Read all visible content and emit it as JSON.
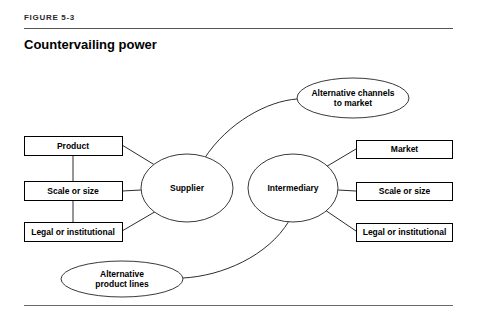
{
  "header": {
    "figure_label": "FIGURE 5-3",
    "title": "Countervailing power"
  },
  "diagram": {
    "type": "relationship-diagram",
    "central_nodes": [
      {
        "id": "supplier",
        "label": "Supplier",
        "shape": "ellipse",
        "cx": 187,
        "cy": 188,
        "rx": 46,
        "ry": 34
      },
      {
        "id": "intermediary",
        "label": "Intermediary",
        "shape": "ellipse",
        "cx": 293,
        "cy": 188,
        "rx": 45,
        "ry": 34
      }
    ],
    "outer_nodes": [
      {
        "id": "alt-channels",
        "label": "Alternative channels\nto market",
        "shape": "ellipse",
        "cx": 353,
        "cy": 98,
        "rx": 56,
        "ry": 20
      },
      {
        "id": "alt-product-lines",
        "label": "Alternative\nproduct lines",
        "shape": "ellipse",
        "cx": 122,
        "cy": 279,
        "rx": 61,
        "ry": 18
      }
    ],
    "left_boxes": [
      {
        "id": "left-product",
        "label": "Product",
        "x": 24,
        "y": 136,
        "w": 98,
        "h": 19
      },
      {
        "id": "left-scale-or-size",
        "label": "Scale or size",
        "x": 24,
        "y": 181,
        "w": 98,
        "h": 19
      },
      {
        "id": "left-legal-or-institutional",
        "label": "Legal or institutional",
        "x": 24,
        "y": 222,
        "w": 98,
        "h": 19
      }
    ],
    "right_boxes": [
      {
        "id": "right-market",
        "label": "Market",
        "x": 356,
        "y": 140,
        "w": 97,
        "h": 18
      },
      {
        "id": "right-scale-or-size",
        "label": "Scale or size",
        "x": 356,
        "y": 182,
        "w": 97,
        "h": 18
      },
      {
        "id": "right-legal-or-institutional",
        "label": "Legal or institutional",
        "x": 356,
        "y": 223,
        "w": 97,
        "h": 18
      }
    ],
    "colors": {
      "stroke": "#000000",
      "connector": "#2d2d2d",
      "rule": "#555555",
      "background": "#ffffff"
    }
  }
}
